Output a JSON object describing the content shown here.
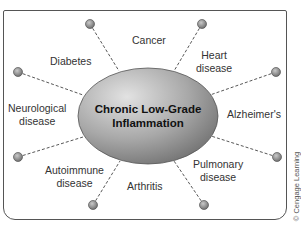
{
  "diagram": {
    "center": {
      "line1": "Chronic Low-Grade",
      "line2": "Inflammation"
    },
    "conditions": [
      {
        "id": "diabetes",
        "lines": [
          "Diabetes"
        ]
      },
      {
        "id": "cancer",
        "lines": [
          "Cancer"
        ]
      },
      {
        "id": "heart",
        "lines": [
          "Heart",
          "disease"
        ]
      },
      {
        "id": "alzheimers",
        "lines": [
          "Alzheimer's"
        ]
      },
      {
        "id": "pulmonary",
        "lines": [
          "Pulmonary",
          "disease"
        ]
      },
      {
        "id": "arthritis",
        "lines": [
          "Arthritis"
        ]
      },
      {
        "id": "autoimmune",
        "lines": [
          "Autoimmune",
          "disease"
        ]
      },
      {
        "id": "neurological",
        "lines": [
          "Neurological",
          "disease"
        ]
      }
    ],
    "credit": "© Cengage Learning",
    "colors": {
      "ellipse_light": "#d8d8d8",
      "ellipse_dark": "#7a7a7a",
      "node": "#8a8a8a",
      "line": "#444444",
      "frame": "#555555"
    }
  }
}
